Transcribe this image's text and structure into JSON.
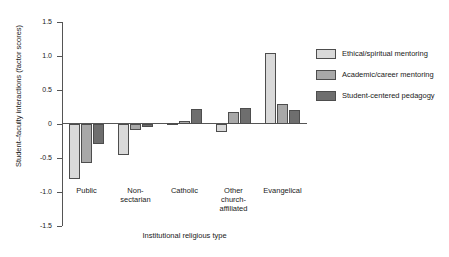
{
  "chart_data": {
    "type": "bar",
    "title": "",
    "xlabel": "Institutional religious type",
    "ylabel": "Student–faculty interactions (factor scores)",
    "categories": [
      "Public",
      "Non-\nsectarian",
      "Catholic",
      "Other\nchurch-\naffiliated",
      "Evangelical"
    ],
    "series": [
      {
        "name": "Ethical/spiritual mentoring",
        "color": "#d9d9d9",
        "values": [
          -0.81,
          -0.45,
          0.02,
          -0.12,
          1.04
        ]
      },
      {
        "name": "Academic/career mentoring",
        "color": "#a8a8a8",
        "values": [
          -0.58,
          -0.09,
          0.04,
          0.17,
          0.3
        ]
      },
      {
        "name": "Student-centered pedagogy",
        "color": "#6e6e6e",
        "values": [
          -0.29,
          -0.05,
          0.22,
          0.24,
          0.2
        ]
      }
    ],
    "ylim": [
      -1.5,
      1.5
    ],
    "yticks": [
      1.5,
      1.0,
      0.5,
      0,
      -0.5,
      -1.0,
      -1.5
    ],
    "ytick_labels": [
      "1.5",
      "1.0",
      "0.5",
      "0",
      "-0.5",
      "-1.0",
      "-1.5"
    ],
    "grid": false,
    "legend_position": "right"
  }
}
